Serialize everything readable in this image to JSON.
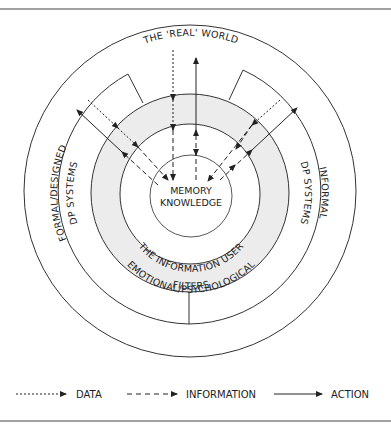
{
  "diagram": {
    "title_top": "THE 'REAL' WORLD",
    "center_line1": "MEMORY",
    "center_line2": "KNOWLEDGE",
    "ring_user": "THE INFORMATION USER",
    "ring_filters_line1": "EMOTIONAL/PSYCHOLOGICAL",
    "ring_filters_line2": "FILTERS",
    "left_box_line1": "FORMAL/DESIGNED",
    "left_box_line2": "DP SYSTEMS",
    "right_box_line1": "INFORMAL",
    "right_box_line2": "DP SYSTEMS",
    "colors": {
      "line": "#333333",
      "filter_ring_fill": "#ececec",
      "background": "#ffffff"
    }
  },
  "legend": {
    "items": [
      {
        "label": "DATA",
        "style": "dotted"
      },
      {
        "label": "INFORMATION",
        "style": "dashed"
      },
      {
        "label": "ACTION",
        "style": "solid"
      }
    ]
  }
}
